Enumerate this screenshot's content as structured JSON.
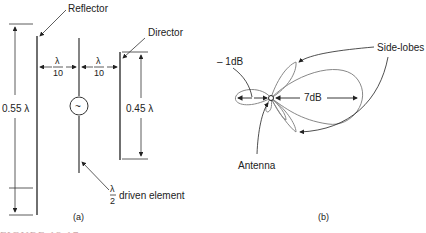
{
  "figure_a": {
    "reflector_label": "Reflector",
    "director_label": "Director",
    "reflector_length": "0.55 λ",
    "director_length": "0.45 λ",
    "spacing_left_num": "λ",
    "spacing_left_den": "10",
    "spacing_right_num": "λ",
    "spacing_right_den": "10",
    "driven_num": "λ",
    "driven_den": "2",
    "driven_label": "driven element",
    "source_symbol": "~",
    "sublabel": "(a)"
  },
  "figure_b": {
    "back_lobe_label": "– 1dB",
    "main_lobe_label": "7dB",
    "side_lobes_label": "Side-lobes",
    "antenna_label": "Antenna",
    "sublabel": "(b)"
  },
  "caption": "FIGURE 13.17",
  "colors": {
    "line": "#333333",
    "pattern": "#888888",
    "caption": "#c8a8a8"
  }
}
